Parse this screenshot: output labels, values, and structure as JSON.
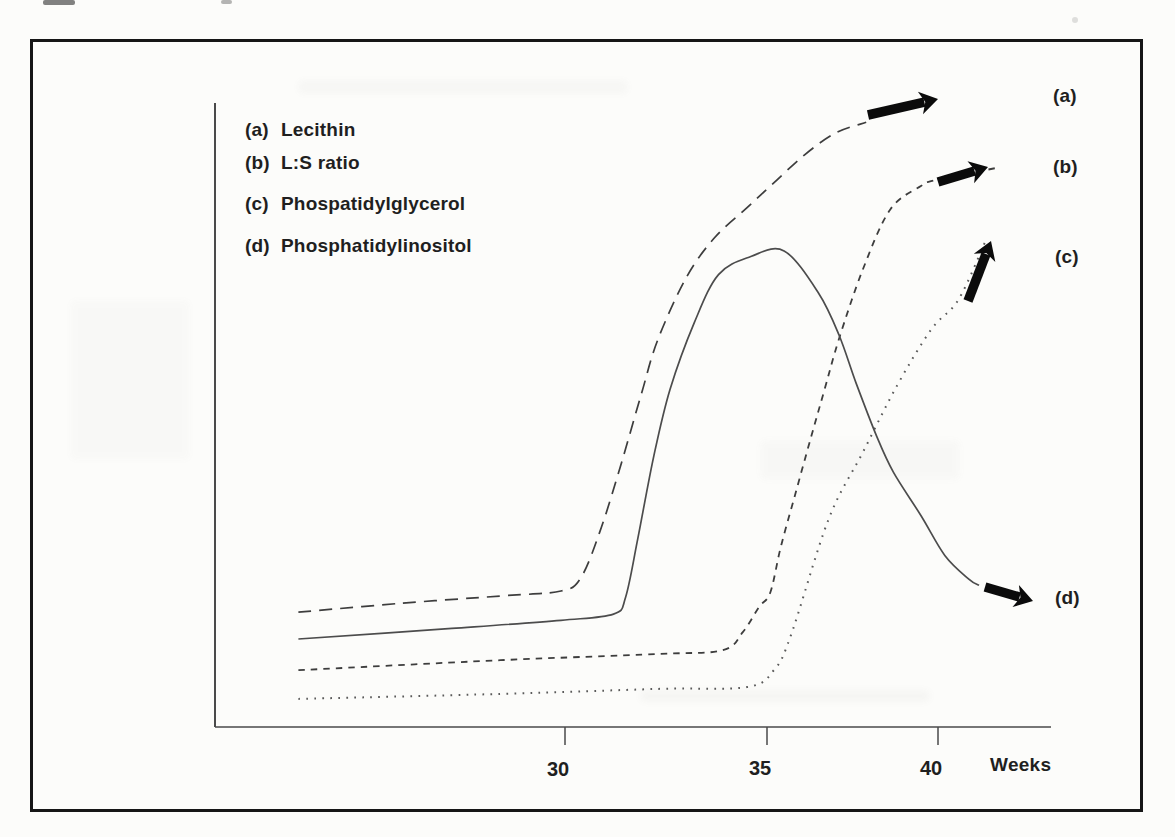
{
  "figure": {
    "legend": {
      "items": [
        {
          "key": "(a)",
          "name": "Lecithin"
        },
        {
          "key": "(b)",
          "name": "L:S ratio"
        },
        {
          "key": "(c)",
          "name": "Phospatidylglycerol"
        },
        {
          "key": "(d)",
          "name": "Phosphatidylinositol"
        }
      ]
    },
    "curve_labels": {
      "a": "(a)",
      "b": "(b)",
      "c": "(c)",
      "d": "(d)"
    },
    "x_ticks": [
      "30",
      "35",
      "40"
    ],
    "x_unit_label": "Weeks"
  },
  "chart_data": {
    "type": "line",
    "title": "",
    "xlabel": "Weeks",
    "ylabel": "",
    "grid": false,
    "legend_position": "top-left inside plot",
    "x_axis": {
      "tick_values": [
        30,
        35,
        40
      ],
      "unit": "weeks of gestation",
      "visible_range_weeks": [
        21.5,
        43
      ]
    },
    "y_axis": {
      "scale": "relative amniotic-fluid phospholipid level (unlabeled axis)",
      "range": [
        0,
        100
      ]
    },
    "series": [
      {
        "id": "a",
        "name": "Lecithin",
        "line_style": "long-dash",
        "points": [
          [
            23.4,
            18.4
          ],
          [
            25.9,
            19.8
          ],
          [
            28.4,
            21.0
          ],
          [
            29.9,
            21.8
          ],
          [
            30.4,
            24.0
          ],
          [
            30.9,
            32.0
          ],
          [
            31.4,
            42.4
          ],
          [
            31.9,
            53.6
          ],
          [
            32.3,
            62.1
          ],
          [
            33.0,
            72.0
          ],
          [
            33.7,
            78.4
          ],
          [
            34.5,
            83.2
          ],
          [
            35.2,
            87.2
          ],
          [
            36.1,
            91.7
          ],
          [
            37.0,
            95.2
          ],
          [
            37.9,
            96.9
          ]
        ]
      },
      {
        "id": "b",
        "name": "L:S ratio",
        "line_style": "short-dash",
        "points": [
          [
            23.4,
            9.1
          ],
          [
            28.4,
            10.7
          ],
          [
            32.3,
            11.7
          ],
          [
            33.9,
            12.3
          ],
          [
            34.4,
            15.2
          ],
          [
            34.8,
            19.2
          ],
          [
            35.1,
            21.6
          ],
          [
            35.4,
            28.8
          ],
          [
            35.8,
            36.8
          ],
          [
            36.3,
            46.7
          ],
          [
            36.7,
            54.4
          ],
          [
            37.1,
            62.1
          ],
          [
            37.8,
            73.3
          ],
          [
            38.6,
            82.9
          ],
          [
            39.5,
            86.7
          ],
          [
            39.9,
            87.6
          ],
          [
            41.8,
            89.7
          ]
        ]
      },
      {
        "id": "c",
        "name": "Phospatidylglycerol",
        "line_style": "dotted",
        "points": [
          [
            23.4,
            4.5
          ],
          [
            28.4,
            5.3
          ],
          [
            32.3,
            6.1
          ],
          [
            34.5,
            6.4
          ],
          [
            35.2,
            9.1
          ],
          [
            35.7,
            14.7
          ],
          [
            36.8,
            33.3
          ],
          [
            37.8,
            44.0
          ],
          [
            38.8,
            54.7
          ],
          [
            39.8,
            63.7
          ],
          [
            40.6,
            68.5
          ],
          [
            41.4,
            78.0
          ]
        ]
      },
      {
        "id": "d",
        "name": "Phosphatidylinositol",
        "line_style": "solid",
        "points": [
          [
            23.4,
            14.1
          ],
          [
            27.2,
            15.8
          ],
          [
            29.9,
            17.1
          ],
          [
            31.2,
            18.1
          ],
          [
            31.5,
            20.8
          ],
          [
            31.8,
            30.1
          ],
          [
            32.2,
            43.5
          ],
          [
            32.6,
            54.1
          ],
          [
            33.2,
            64.8
          ],
          [
            33.8,
            72.5
          ],
          [
            34.6,
            75.4
          ],
          [
            35.5,
            76.3
          ],
          [
            36.5,
            69.6
          ],
          [
            37.1,
            62.9
          ],
          [
            37.6,
            55.2
          ],
          [
            38.2,
            46.7
          ],
          [
            38.7,
            40.8
          ],
          [
            39.5,
            33.9
          ],
          [
            40.2,
            27.5
          ],
          [
            40.9,
            23.7
          ],
          [
            41.2,
            22.7
          ]
        ]
      }
    ],
    "annotations": {
      "arrows": [
        {
          "series": "a",
          "tail_px": [
            868,
            115
          ],
          "head_px": [
            938,
            99
          ]
        },
        {
          "series": "b",
          "tail_px": [
            938,
            182
          ],
          "head_px": [
            988,
            167
          ]
        },
        {
          "series": "c",
          "tail_px": [
            968,
            301
          ],
          "head_px": [
            991,
            241
          ]
        },
        {
          "series": "d",
          "tail_px": [
            985,
            587
          ],
          "head_px": [
            1033,
            601
          ]
        }
      ]
    },
    "layout": {
      "week_px_anchors": [
        [
          30,
          565
        ],
        [
          35,
          767
        ],
        [
          40,
          938
        ]
      ],
      "axis_px": {
        "x0": 215,
        "y0": 727,
        "x1": 1051,
        "y_top": 103
      }
    }
  }
}
